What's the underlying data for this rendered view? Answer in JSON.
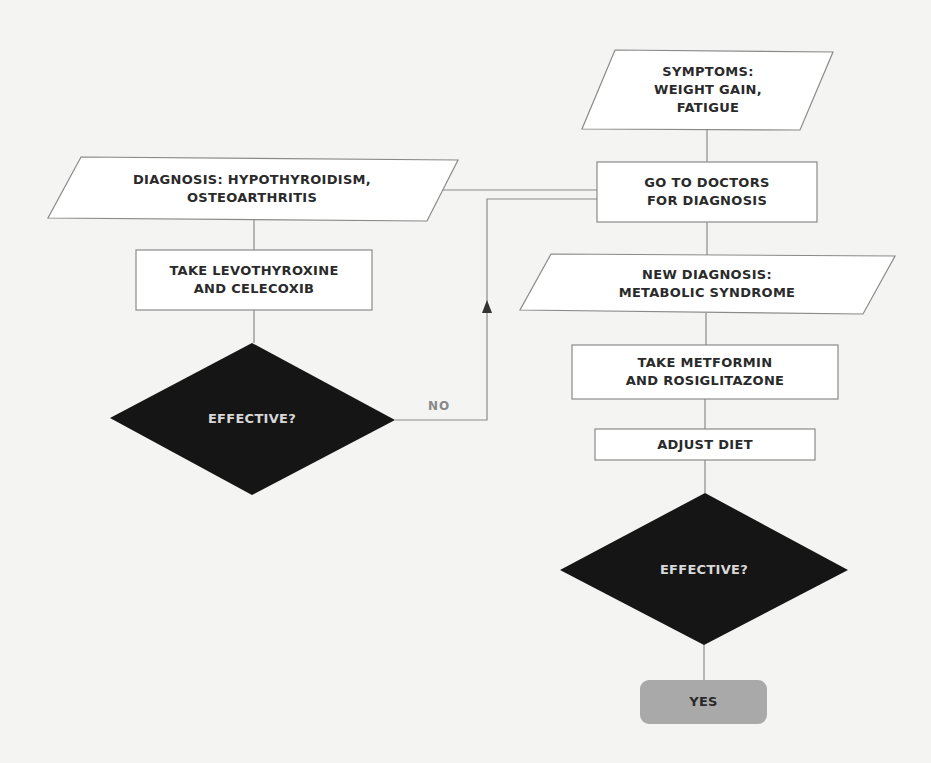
{
  "colors": {
    "background": "#f4f4f3",
    "box_fill": "#ffffff",
    "box_stroke": "#8a8a8a",
    "decision_fill": "#151515",
    "decision_text": "#d8d8d8",
    "terminal_fill": "#a9a9a9",
    "text": "#2a2a2a",
    "label_text": "#888888"
  },
  "nodes": {
    "symptoms": {
      "type": "input-output",
      "text": "SYMPTOMS:\nWEIGHT GAIN,\nFATIGUE"
    },
    "go_to_doctors": {
      "type": "process",
      "text": "GO TO DOCTORS\nFOR DIAGNOSIS"
    },
    "diagnosis_1": {
      "type": "input-output",
      "text": "DIAGNOSIS: HYPOTHYROIDISM,\nOSTEOARTHRITIS"
    },
    "take_levo": {
      "type": "process",
      "text": "TAKE LEVOTHYROXINE\nAND CELECOXIB"
    },
    "effective_1": {
      "type": "decision",
      "text": "EFFECTIVE?"
    },
    "new_diagnosis": {
      "type": "input-output",
      "text": "NEW DIAGNOSIS:\nMETABOLIC SYNDROME"
    },
    "take_metformin": {
      "type": "process",
      "text": "TAKE METFORMIN\nAND ROSIGLITAZONE"
    },
    "adjust_diet": {
      "type": "process",
      "text": "ADJUST DIET"
    },
    "effective_2": {
      "type": "decision",
      "text": "EFFECTIVE?"
    },
    "yes": {
      "type": "terminal",
      "text": "YES"
    }
  },
  "edge_labels": {
    "no": "NO"
  },
  "edges": [
    {
      "from": "symptoms",
      "to": "go_to_doctors"
    },
    {
      "from": "go_to_doctors",
      "to": "diagnosis_1"
    },
    {
      "from": "diagnosis_1",
      "to": "take_levo"
    },
    {
      "from": "take_levo",
      "to": "effective_1"
    },
    {
      "from": "effective_1",
      "to": "go_to_doctors",
      "label": "NO"
    },
    {
      "from": "go_to_doctors",
      "to": "new_diagnosis"
    },
    {
      "from": "new_diagnosis",
      "to": "take_metformin"
    },
    {
      "from": "take_metformin",
      "to": "adjust_diet"
    },
    {
      "from": "adjust_diet",
      "to": "effective_2"
    },
    {
      "from": "effective_2",
      "to": "yes"
    }
  ]
}
